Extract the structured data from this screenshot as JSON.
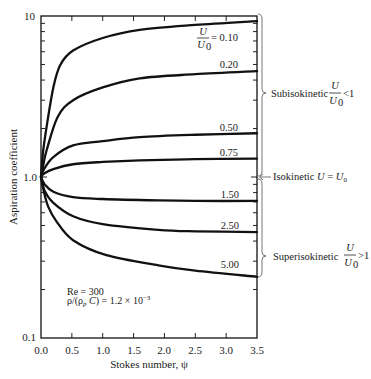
{
  "chart_data": {
    "type": "line",
    "title": "",
    "xlabel": "Stokes number, ψ",
    "ylabel": "Aspiration coefficient",
    "xlim": [
      0,
      3.5
    ],
    "ylim": [
      0.1,
      10
    ],
    "yscale": "log",
    "grid": false,
    "legend": "none - curves labeled inline by U/U0",
    "x_ticks": [
      0,
      0.5,
      1.0,
      1.5,
      2.0,
      2.5,
      3.0,
      3.5
    ],
    "x_tick_labels": [
      "0.0",
      "0.5",
      "1.0",
      "1.5",
      "2.0",
      "2.5",
      "3.0",
      "3.5"
    ],
    "y_ticks": [
      0.1,
      1.0,
      10
    ],
    "y_tick_labels": [
      "0.1",
      "1.0",
      "10"
    ],
    "series_parameter": "U/U0",
    "series": [
      {
        "name": "U/U0 = 0.10",
        "label": "0.10",
        "x": [
          0,
          0.03,
          0.09,
          0.2,
          0.31,
          0.52,
          1.0,
          1.6,
          2.5,
          3.5
        ],
        "y": [
          1.0,
          1.4,
          2.04,
          3.6,
          4.95,
          6.1,
          7.3,
          8.2,
          8.8,
          9.3
        ]
      },
      {
        "name": "U/U0 = 0.20",
        "label": "0.20",
        "x": [
          0,
          0.04,
          0.09,
          0.27,
          0.52,
          1.0,
          1.6,
          2.5,
          3.5
        ],
        "y": [
          1.0,
          1.2,
          1.46,
          2.36,
          3.0,
          3.6,
          4.1,
          4.35,
          4.55
        ]
      },
      {
        "name": "U/U0 = 0.50",
        "label": "0.50",
        "x": [
          0,
          0.05,
          0.2,
          0.52,
          1.0,
          1.6,
          2.5,
          3.5
        ],
        "y": [
          1.0,
          1.12,
          1.33,
          1.57,
          1.67,
          1.77,
          1.83,
          1.87
        ]
      },
      {
        "name": "U/U0 = 0.75",
        "label": "0.75",
        "x": [
          0,
          0.05,
          0.2,
          0.52,
          1.0,
          1.6,
          2.5,
          3.5
        ],
        "y": [
          1.0,
          1.05,
          1.12,
          1.2,
          1.24,
          1.27,
          1.29,
          1.3
        ]
      },
      {
        "name": "U/U0 = 1.50",
        "label": "1.50",
        "x": [
          0,
          0.06,
          0.2,
          0.52,
          1.0,
          1.9,
          2.5,
          3.5
        ],
        "y": [
          1.0,
          0.9,
          0.81,
          0.75,
          0.73,
          0.715,
          0.71,
          0.71
        ]
      },
      {
        "name": "U/U0 = 2.50",
        "label": "2.50",
        "x": [
          0,
          0.06,
          0.2,
          0.52,
          1.0,
          1.9,
          2.5,
          3.5
        ],
        "y": [
          1.0,
          0.82,
          0.69,
          0.57,
          0.51,
          0.47,
          0.46,
          0.455
        ]
      },
      {
        "name": "U/U0 = 5.00",
        "label": "5.00",
        "x": [
          0,
          0.05,
          0.12,
          0.25,
          0.52,
          1.06,
          1.9,
          2.5,
          3.5
        ],
        "y": [
          1.0,
          0.8,
          0.65,
          0.53,
          0.405,
          0.327,
          0.283,
          0.262,
          0.24
        ]
      }
    ],
    "annotations": {
      "first_curve_label": {
        "num": "U",
        "den": "U",
        "den_sub": "0",
        "eq": "= 0.10"
      },
      "regions": {
        "sub": {
          "text": "Subisokinetic",
          "num": "U",
          "den": "U",
          "den_sub": "0",
          "relation": "<1"
        },
        "iso": {
          "text": "Isokinetic ",
          "lhs": "U",
          "eq": " = ",
          "rhs": "U",
          "rhs_sub": "0"
        },
        "super": {
          "text": "Superisokinetic",
          "num": "U",
          "den": "U",
          "den_sub": "0",
          "relation": ">1"
        }
      },
      "conditions": {
        "reynolds": "Re = 300",
        "density_ratio": {
          "p1": "ρ/(ρ",
          "sub": "p",
          "p2": " ",
          "italic": "C",
          "p3": ") = 1.2 × 10",
          "sup": "−3"
        }
      }
    }
  }
}
